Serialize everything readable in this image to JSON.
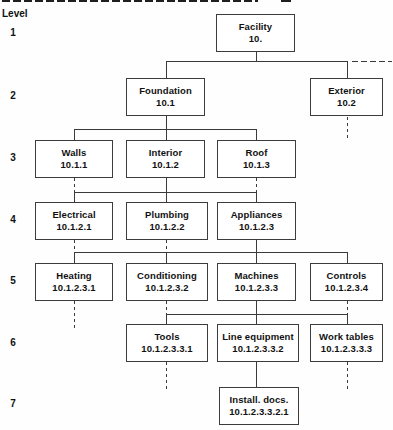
{
  "legend": {
    "label": "Level",
    "levels": [
      "1",
      "2",
      "3",
      "4",
      "5",
      "6",
      "7"
    ]
  },
  "diagram": {
    "type": "tree",
    "description_colors": {
      "line": "#3a3a3a",
      "text": "#111111",
      "background": "#ffffff"
    },
    "nodes": [
      {
        "name": "Facility",
        "code": "10.",
        "level": 1
      },
      {
        "name": "Foundation",
        "code": "10.1",
        "level": 2
      },
      {
        "name": "Exterior",
        "code": "10.2",
        "level": 2
      },
      {
        "name": "Walls",
        "code": "10.1.1",
        "level": 3
      },
      {
        "name": "Interior",
        "code": "10.1.2",
        "level": 3
      },
      {
        "name": "Roof",
        "code": "10.1.3",
        "level": 3
      },
      {
        "name": "Electrical",
        "code": "10.1.2.1",
        "level": 4
      },
      {
        "name": "Plumbing",
        "code": "10.1.2.2",
        "level": 4
      },
      {
        "name": "Appliances",
        "code": "10.1.2.3",
        "level": 4
      },
      {
        "name": "Heating",
        "code": "10.1.2.3.1",
        "level": 5
      },
      {
        "name": "Conditioning",
        "code": "10.1.2.3.2",
        "level": 5
      },
      {
        "name": "Machines",
        "code": "10.1.2.3.3",
        "level": 5
      },
      {
        "name": "Controls",
        "code": "10.1.2.3.4",
        "level": 5
      },
      {
        "name": "Tools",
        "code": "10.1.2.3.3.1",
        "level": 6
      },
      {
        "name": "Line equipment",
        "code": "10.1.2.3.3.2",
        "level": 6
      },
      {
        "name": "Work tables",
        "code": "10.1.2.3.3.3",
        "level": 6
      },
      {
        "name": "Install. docs.",
        "code": "10.1.2.3.3.2.1",
        "level": 7
      }
    ]
  }
}
